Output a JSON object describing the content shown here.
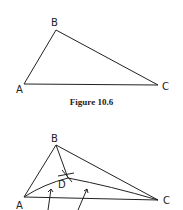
{
  "figure1": {
    "caption": "Figure 10.6",
    "labels": {
      "A": "A",
      "B": "B",
      "C": "C"
    },
    "points": {
      "A": [
        24,
        84
      ],
      "B": [
        56,
        30
      ],
      "C": [
        158,
        85
      ]
    }
  },
  "figure2": {
    "labels": {
      "A": "A",
      "B": "B",
      "C": "C",
      "D": "D"
    },
    "points": {
      "A": [
        24,
        197
      ],
      "B": [
        56,
        145
      ],
      "C": [
        158,
        200
      ],
      "D": [
        68,
        178
      ]
    }
  }
}
